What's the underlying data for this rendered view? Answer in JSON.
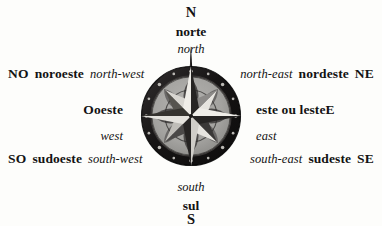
{
  "diagram": {
    "background_color": "#fdfdfb",
    "text_color": "#131313"
  },
  "compass": {
    "icon_name": "compass-rose",
    "colors": {
      "ring_dark": "#1c1a1a",
      "ring_outer_edge": "#2a2727",
      "disc_light": "#a9a9a9",
      "petal_dark": "#4f4d4d",
      "star_light": "#e9e7e2",
      "star_mid": "#8a8887",
      "star_dark": "#201e1e",
      "stud_light": "#cfcdc8"
    },
    "points": 8,
    "needle_direction": "north"
  },
  "directions": {
    "north": {
      "abbr": "N",
      "pt": "norte",
      "en": "north"
    },
    "northwest": {
      "abbr": "NO",
      "pt": "noroeste",
      "en": "north-west"
    },
    "northeast": {
      "abbr": "NE",
      "pt": "nordeste",
      "en": "north-east"
    },
    "west": {
      "abbr": "O",
      "pt": "oeste",
      "en": "west"
    },
    "east": {
      "abbr": "E",
      "pt": "este ou leste",
      "en": "east"
    },
    "southwest": {
      "abbr": "SO",
      "pt": "sudoeste",
      "en": "south-west"
    },
    "southeast": {
      "abbr": "SE",
      "pt": "sudeste",
      "en": "south-east"
    },
    "south": {
      "abbr": "S",
      "pt": "sul",
      "en": "south"
    }
  }
}
